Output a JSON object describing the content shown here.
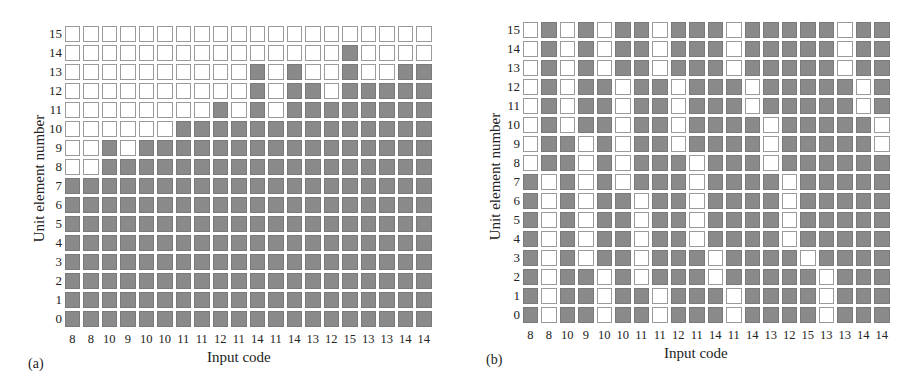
{
  "chart_data": [
    {
      "type": "heatmap",
      "panel_label": "(a)",
      "xlabel": "Input code",
      "ylabel": "Unit element number",
      "y_ticks": [
        "15",
        "14",
        "13",
        "12",
        "11",
        "10",
        "9",
        "8",
        "7",
        "6",
        "5",
        "4",
        "3",
        "2",
        "1",
        "0"
      ],
      "x_ticks": [
        "8",
        "8",
        "10",
        "9",
        "10",
        "10",
        "11",
        "11",
        "12",
        "11",
        "14",
        "11",
        "14",
        "13",
        "12",
        "15",
        "13",
        "13",
        "14",
        "14"
      ],
      "legend": {
        "dark": "unit element on",
        "white": "unit element off"
      },
      "rows_top_to_bottom": [
        "00000000000000000000",
        "00000000000000010000",
        "00000000001010010011",
        "00000000001011011111",
        "00000000101011111111",
        "00000011111111111111",
        "00101111111111111111",
        "00111111111111111111",
        "11111111111111111111",
        "11111111111111111111",
        "11111111111111111111",
        "11111111111111111111",
        "11111111111111111111",
        "11111111111111111111",
        "11111111111111111111",
        "11111111111111111111"
      ]
    },
    {
      "type": "heatmap",
      "panel_label": "(b)",
      "xlabel": "Input code",
      "ylabel": "Unit element number",
      "y_ticks": [
        "15",
        "14",
        "13",
        "12",
        "11",
        "10",
        "9",
        "8",
        "7",
        "6",
        "5",
        "4",
        "3",
        "2",
        "1",
        "0"
      ],
      "x_ticks": [
        "8",
        "8",
        "10",
        "9",
        "10",
        "10",
        "11",
        "11",
        "12",
        "11",
        "14",
        "11",
        "14",
        "13",
        "12",
        "15",
        "13",
        "13",
        "14",
        "14"
      ],
      "legend": {
        "dark": "unit element on",
        "white": "unit element off"
      },
      "rows_top_to_bottom": [
        "01010110111011111011",
        "01010110111011111011",
        "01010110111011111011",
        "01011011011101111101",
        "01011011011101111101",
        "01011011011110111110",
        "01101011011110111110",
        "01101011101110111111",
        "10101011101111011111",
        "10101101101111011111",
        "10101101101111011111",
        "10101101101111011111",
        "10101101110111101111",
        "10110101110111110111",
        "10110110111011110111",
        "10110110111011110111"
      ]
    }
  ],
  "colors": {
    "on": "#8a8a8a",
    "off": "#ffffff",
    "border": "#9a9a9a",
    "text": "#222222"
  }
}
